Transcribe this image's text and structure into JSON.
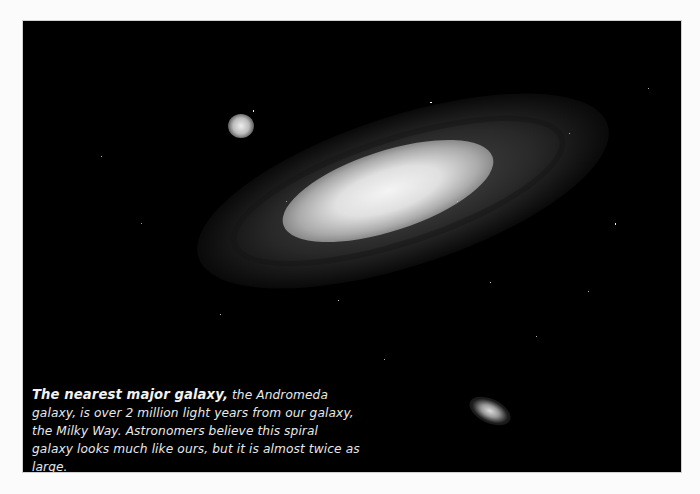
{
  "figure": {
    "background_color": "#000000",
    "page_color": "#fbfbfb"
  },
  "caption": {
    "lead": "The nearest major galaxy,",
    "body": " the Andromeda galaxy, is over 2 million light years from our galaxy, the Milky Way. Astronomers believe this spiral galaxy looks much like ours, but it is almost twice as large."
  }
}
